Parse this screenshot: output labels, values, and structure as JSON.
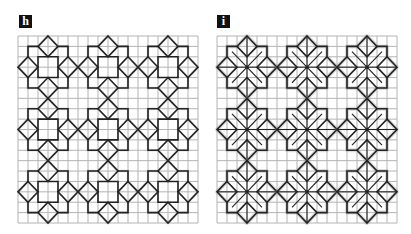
{
  "figure": {
    "panels": [
      {
        "id": "h",
        "label": "h",
        "variant": "square-core",
        "grid": {
          "cols": 18,
          "rows": 18
        },
        "motif_centers": [
          [
            3,
            3
          ],
          [
            9,
            3
          ],
          [
            15,
            3
          ],
          [
            3,
            9
          ],
          [
            9,
            9
          ],
          [
            15,
            9
          ],
          [
            3,
            15
          ],
          [
            9,
            15
          ],
          [
            15,
            15
          ]
        ]
      },
      {
        "id": "i",
        "label": "i",
        "variant": "star-spokes",
        "grid": {
          "cols": 18,
          "rows": 18
        },
        "motif_centers": [
          [
            3,
            3
          ],
          [
            9,
            3
          ],
          [
            15,
            3
          ],
          [
            3,
            9
          ],
          [
            9,
            9
          ],
          [
            15,
            9
          ],
          [
            3,
            15
          ],
          [
            9,
            15
          ],
          [
            15,
            15
          ]
        ]
      }
    ],
    "colors": {
      "grid_line": "#b4b4b4",
      "motif_line": "#222222",
      "halo": "#9a9a9a",
      "label_bg": "#111111",
      "label_text": "#ffffff"
    }
  }
}
